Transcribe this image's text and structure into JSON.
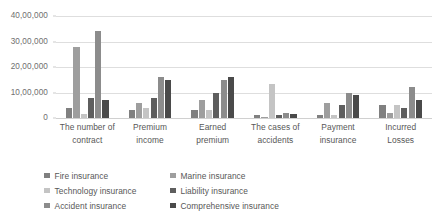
{
  "chart_data": {
    "type": "bar",
    "title": "",
    "subtitle": "",
    "xlabel": "",
    "ylabel": "",
    "ylim": [
      0,
      4000000
    ],
    "grid": true,
    "legend_position": "bottom",
    "ytick_labels": [
      "40,00,000",
      "30,00,000",
      "20,00,000",
      "10,00,000",
      "0"
    ],
    "ytick_values": [
      4000000,
      3000000,
      2000000,
      1000000,
      0
    ],
    "categories": [
      "The number of contract",
      "Premium income",
      "Earned premium",
      "The cases of accidents",
      "Payment insurance",
      "Incurred Losses"
    ],
    "category_lines": [
      [
        "The number of",
        "contract"
      ],
      [
        "Premium",
        "income"
      ],
      [
        "Earned",
        "premium"
      ],
      [
        "The cases of",
        "accidents"
      ],
      [
        "Payment",
        "insurance"
      ],
      [
        "Incurred",
        "Losses"
      ]
    ],
    "series": [
      {
        "name": "Fire insurance",
        "color": "#808080",
        "values": [
          400000,
          300000,
          300000,
          100000,
          100000,
          500000
        ]
      },
      {
        "name": "Marine insurance",
        "color": "#9e9e9e",
        "values": [
          2800000,
          600000,
          700000,
          50000,
          600000,
          200000
        ]
      },
      {
        "name": "Technology insurance",
        "color": "#c4c4c4",
        "values": [
          150000,
          400000,
          300000,
          1350000,
          100000,
          500000
        ]
      },
      {
        "name": "Liability insurance",
        "color": "#5e5e5e",
        "values": [
          800000,
          800000,
          1000000,
          100000,
          500000,
          400000
        ]
      },
      {
        "name": "Accident insurance",
        "color": "#8c8c8c",
        "values": [
          3400000,
          1600000,
          1500000,
          200000,
          1000000,
          1200000
        ]
      },
      {
        "name": "Comprehensive insurance",
        "color": "#4a4a4a",
        "values": [
          700000,
          1500000,
          1600000,
          150000,
          900000,
          700000
        ]
      }
    ]
  }
}
